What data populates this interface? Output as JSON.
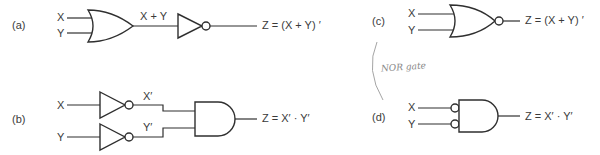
{
  "diagram": {
    "panels": [
      {
        "id": "a",
        "label": "(a)",
        "inputs": [
          "X",
          "Y"
        ],
        "intermediate": "X + Y",
        "output": "Z  = (X + Y) ′",
        "description": "OR gate followed by NOT gate"
      },
      {
        "id": "b",
        "label": "(b)",
        "inputs": [
          "X",
          "Y"
        ],
        "intermediate": [
          "X′",
          "Y′"
        ],
        "output": "Z  = X′ · Y′",
        "description": "Two NOT gates feeding an AND gate"
      },
      {
        "id": "c",
        "label": "(c)",
        "inputs": [
          "X",
          "Y"
        ],
        "output": "Z  = (X + Y) ′",
        "description": "NOR gate"
      },
      {
        "id": "d",
        "label": "(d)",
        "inputs": [
          "X",
          "Y"
        ],
        "output": "Z  = X′ · Y′",
        "description": "AND gate with inverted inputs"
      }
    ],
    "annotation": "NOR gate"
  }
}
